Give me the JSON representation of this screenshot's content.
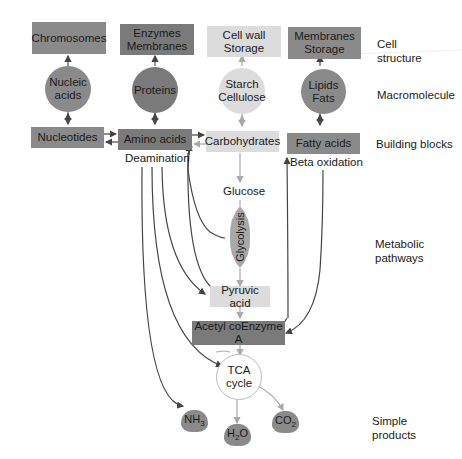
{
  "levels": {
    "cell_structure": "Cell\nstructure",
    "cell_structure_l1": "Cell",
    "cell_structure_l2": "structure",
    "macromolecule": "Macromolecule",
    "building_blocks": "Building blocks",
    "metabolic_l1": "Metabolic",
    "metabolic_l2": "pathways",
    "simple_l1": "Simple",
    "simple_l2": "products"
  },
  "cell_structure": {
    "chromosomes": "Chromosomes",
    "enzymes_l1": "Enzymes",
    "enzymes_l2": "Membranes",
    "cellwall_l1": "Cell wall",
    "cellwall_l2": "Storage",
    "membranes_l1": "Membranes",
    "membranes_l2": "Storage"
  },
  "macromolecules": {
    "nucleic_l1": "Nucleic",
    "nucleic_l2": "acids",
    "proteins": "Proteins",
    "starch_l1": "Starch",
    "starch_l2": "Cellulose",
    "lipids_l1": "Lipids",
    "lipids_l2": "Fats"
  },
  "building_blocks": {
    "nucleotides": "Nucleotides",
    "amino_acids": "Amino acids",
    "carbohydrates": "Carbohydrates",
    "fatty_acids": "Fatty acids"
  },
  "pathways": {
    "deamination": "Deamination",
    "beta_oxidation": "Beta oxidation",
    "glucose": "Glucose",
    "glycolysis": "Glycolysis",
    "pyruvic_acid": "Pyruvic acid",
    "acetyl_coa": "Acetyl coEnzyme A",
    "tca_l1": "TCA",
    "tca_l2": "cycle"
  },
  "products": {
    "nh3_base": "NH",
    "nh3_sub": "3",
    "h2o_base": "H",
    "h2o_sub": "2",
    "h2o_end": "O",
    "co2_base": "CO",
    "co2_sub": "2"
  },
  "colors": {
    "dark_box": "#8a8a8a",
    "light_box": "#dcdcdc",
    "arrow_dark": "#444444",
    "arrow_light": "#aaaaaa"
  }
}
